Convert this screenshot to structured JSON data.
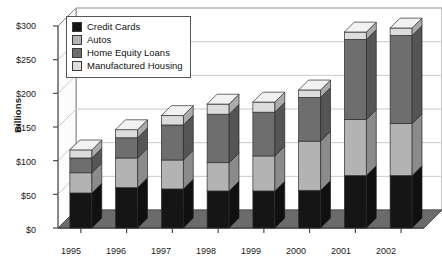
{
  "chart_data": {
    "type": "bar",
    "subtype": "stacked-3d-column",
    "title": "",
    "xlabel": "",
    "ylabel": "Billions",
    "categories": [
      "1995",
      "1996",
      "1997",
      "1998",
      "1999",
      "2000",
      "2001",
      "2002"
    ],
    "ylim": [
      0,
      300
    ],
    "ytick_labels": [
      "$0",
      "$50",
      "$100",
      "$150",
      "$200",
      "$250",
      "$300"
    ],
    "ytick_values": [
      0,
      50,
      100,
      150,
      200,
      250,
      300
    ],
    "grid": true,
    "grid_axis": "y",
    "legend_position": "top-left inside plot",
    "stack_order": "bottom-to-top",
    "series": [
      {
        "name": "Credit Cards",
        "color": "#151515",
        "values": [
          52,
          60,
          58,
          55,
          55,
          56,
          78,
          78
        ]
      },
      {
        "name": "Autos",
        "color": "#b3b3b3",
        "values": [
          30,
          44,
          43,
          42,
          52,
          73,
          83,
          77
        ]
      },
      {
        "name": "Home Equity Loans",
        "color": "#6e6e6e",
        "values": [
          22,
          30,
          52,
          72,
          65,
          65,
          119,
          131
        ]
      },
      {
        "name": "Manufactured Housing",
        "color": "#dcdcdc",
        "values": [
          12,
          12,
          14,
          15,
          15,
          11,
          11,
          11
        ]
      }
    ],
    "totals": [
      116,
      146,
      167,
      184,
      187,
      205,
      291,
      297
    ]
  },
  "legend": {
    "items": [
      {
        "label": "Credit Cards",
        "color": "#151515"
      },
      {
        "label": "Autos",
        "color": "#b3b3b3"
      },
      {
        "label": "Home Equity Loans",
        "color": "#6e6e6e"
      },
      {
        "label": "Manufactured Housing",
        "color": "#dcdcdc"
      }
    ]
  },
  "axes": {
    "y_title": "Billions",
    "y_ticks": [
      "$300",
      "$250",
      "$200",
      "$150",
      "$100",
      "$50",
      "$0"
    ],
    "x_ticks": [
      "1995",
      "1996",
      "1997",
      "1998",
      "1999",
      "2000",
      "2001",
      "2002"
    ]
  },
  "colors": {
    "floor": "#6b6b6b",
    "wall": "#ffffff",
    "frame": "#8a8a8a",
    "grid": "#c9c9c9",
    "text": "#1a1a1a",
    "bar_top_light": "#f2f2f2",
    "bar_side_shade": "#000000"
  }
}
